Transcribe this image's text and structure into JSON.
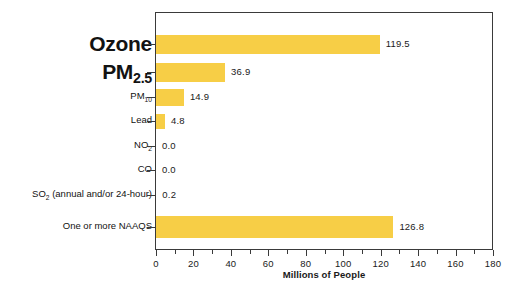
{
  "chart_data": {
    "type": "bar",
    "orientation": "horizontal",
    "title": "",
    "xlabel": "Millions of People",
    "ylabel": "",
    "xlim": [
      0,
      180
    ],
    "grid": false,
    "legend": null,
    "bar_color": "#F7CE46",
    "xticks_major": [
      0,
      20,
      40,
      60,
      80,
      100,
      120,
      140,
      160,
      180
    ],
    "xticks_major_labels": [
      "0",
      "20",
      "40",
      "60",
      "80",
      "100",
      "120",
      "140",
      "160",
      "180"
    ],
    "xticks_minor": [
      10,
      30,
      50,
      70,
      90,
      110,
      130,
      150,
      170
    ],
    "categories": [
      "Ozone",
      "PM2.5",
      "PM10",
      "Lead",
      "NO2",
      "CO",
      "SO2 (annual and/or 24-hour)",
      "One or more NAAQS"
    ],
    "values": [
      119.5,
      36.9,
      14.9,
      4.8,
      0.0,
      0.0,
      0.2,
      126.8
    ],
    "value_labels": [
      "119.5",
      "36.9",
      "14.9",
      "4.8",
      "0.0",
      "0.0",
      "0.2",
      "126.8"
    ]
  },
  "categories_display": [
    {
      "main": "Ozone",
      "sub": "",
      "tail": "",
      "emphasis": "big"
    },
    {
      "main": "PM",
      "sub": "2.5",
      "tail": "",
      "emphasis": "big"
    },
    {
      "main": "PM",
      "sub": "10",
      "tail": "",
      "emphasis": "small"
    },
    {
      "main": "Lead",
      "sub": "",
      "tail": "",
      "emphasis": "small"
    },
    {
      "main": "NO",
      "sub": "2",
      "tail": "",
      "emphasis": "small"
    },
    {
      "main": "CO",
      "sub": "",
      "tail": "",
      "emphasis": "small"
    },
    {
      "main": "SO",
      "sub": "2",
      "tail": " (annual and/or 24-hour)",
      "emphasis": "small"
    },
    {
      "main": "One or more NAAQS",
      "sub": "",
      "tail": "",
      "emphasis": "small"
    }
  ]
}
